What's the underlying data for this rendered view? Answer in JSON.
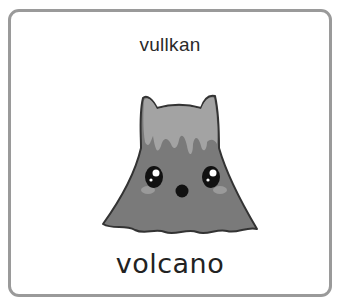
{
  "card": {
    "top_word": "vullkan",
    "bottom_word": "volcano",
    "illustration": "volcano-character-icon"
  },
  "colors": {
    "border": "#9a9a9a",
    "volcano_body": "#7a7a7a",
    "lava": "#a0a0a0",
    "outline": "#333333"
  }
}
